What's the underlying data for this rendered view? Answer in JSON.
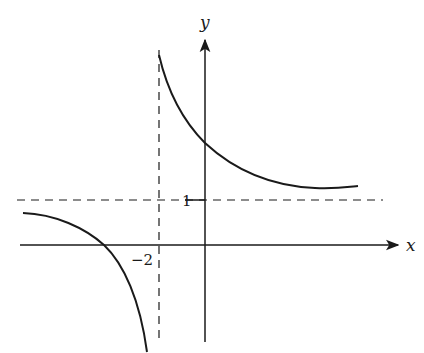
{
  "diagram": {
    "type": "function-graph",
    "axes": {
      "x_label": "x",
      "y_label": "y"
    },
    "asymptotes": {
      "vertical": {
        "x": -2,
        "label": "−2"
      },
      "horizontal": {
        "y": 1,
        "label": "1"
      }
    },
    "branches": [
      {
        "name": "left-branch",
        "description": "Below horizontal asymptote, crosses x-axis left of x=-2, descends toward -infinity approaching x=-2"
      },
      {
        "name": "right-branch",
        "description": "Above horizontal asymptote, descends from +infinity near x=-2, crosses y-axis above 1, levels off toward y=1"
      }
    ],
    "colors": {
      "stroke": "#1a1a1a",
      "background": "#ffffff"
    }
  }
}
